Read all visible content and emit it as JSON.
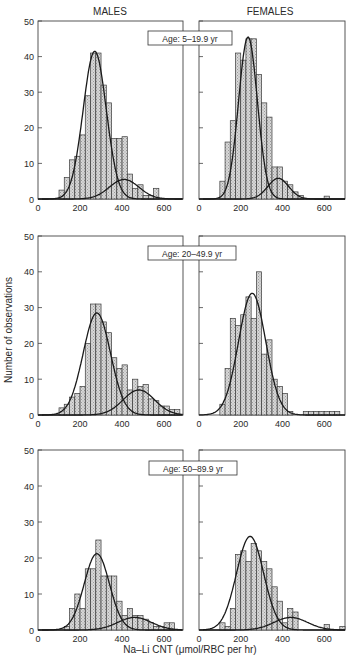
{
  "figure": {
    "column_titles": [
      "MALES",
      "FEMALES"
    ],
    "ylabel": "Number of observations",
    "xlabel": "Na–Li CNT (μmol/RBC per hr)",
    "yticks": [
      0,
      10,
      20,
      30,
      40,
      50
    ],
    "xticks": [
      0,
      200,
      400,
      600
    ],
    "age_labels": [
      "Age: 5–19.9 yr",
      "Age: 20–49.9 yr",
      "Age: 50–89.9 yr"
    ]
  },
  "chart_data": [
    {
      "type": "bar",
      "title": "MALES, Age: 5–19.9 yr",
      "xlabel": "Na–Li CNT (μmol/RBC per hr)",
      "ylabel": "Number of observations",
      "xlim": [
        0,
        690
      ],
      "ylim": [
        0,
        50
      ],
      "bin_width": 25,
      "bin_starts": [
        100,
        125,
        150,
        175,
        200,
        225,
        250,
        275,
        300,
        325,
        350,
        375,
        400,
        425,
        450,
        475,
        500,
        525,
        550
      ],
      "values": [
        2.5,
        6,
        11,
        12,
        18,
        29,
        41,
        41,
        32,
        27,
        17,
        17,
        17.5,
        7,
        3,
        4,
        1,
        1,
        3
      ],
      "fits": [
        {
          "name": "component 1",
          "mean": 270,
          "sd": 55,
          "peak": 41.5
        },
        {
          "name": "component 2",
          "mean": 410,
          "sd": 70,
          "peak": 5.5
        }
      ]
    },
    {
      "type": "bar",
      "title": "FEMALES, Age: 5–19.9 yr",
      "xlabel": "Na–Li CNT (μmol/RBC per hr)",
      "ylabel": "Number of observations",
      "xlim": [
        0,
        700
      ],
      "ylim": [
        0,
        50
      ],
      "bin_width": 25,
      "bin_starts": [
        100,
        125,
        150,
        175,
        200,
        225,
        250,
        275,
        300,
        325,
        350,
        375,
        400,
        425,
        450,
        475,
        600
      ],
      "values": [
        5,
        16,
        22,
        41,
        39,
        45,
        45,
        35,
        27,
        23,
        9,
        9,
        5,
        4,
        2,
        1,
        0.8
      ],
      "fits": [
        {
          "name": "component 1",
          "mean": 235,
          "sd": 45,
          "peak": 45.5
        },
        {
          "name": "component 2",
          "mean": 380,
          "sd": 50,
          "peak": 5.8
        }
      ]
    },
    {
      "type": "bar",
      "title": "MALES, Age: 20–49.9 yr",
      "xlabel": "Na–Li CNT (μmol/RBC per hr)",
      "ylabel": "Number of observations",
      "xlim": [
        0,
        690
      ],
      "ylim": [
        0,
        50
      ],
      "bin_width": 25,
      "bin_starts": [
        100,
        125,
        150,
        175,
        200,
        225,
        250,
        275,
        300,
        325,
        350,
        375,
        400,
        425,
        450,
        475,
        500,
        525,
        550,
        575,
        600,
        625,
        650
      ],
      "values": [
        2,
        3,
        5,
        6,
        8,
        20,
        31,
        31,
        26,
        23,
        16,
        13,
        14,
        7,
        10,
        8,
        8.5,
        4.5,
        4,
        2.5,
        2.5,
        1.5,
        1.5
      ],
      "fits": [
        {
          "name": "component 1",
          "mean": 280,
          "sd": 65,
          "peak": 28.5
        },
        {
          "name": "component 2",
          "mean": 480,
          "sd": 75,
          "peak": 7
        }
      ]
    },
    {
      "type": "bar",
      "title": "FEMALES, Age: 20–49.9 yr",
      "xlabel": "Na–Li CNT (μmol/RBC per hr)",
      "ylabel": "Number of observations",
      "xlim": [
        0,
        700
      ],
      "ylim": [
        0,
        50
      ],
      "bin_width": 25,
      "bin_starts": [
        100,
        125,
        150,
        175,
        200,
        225,
        250,
        275,
        300,
        325,
        350,
        375,
        400,
        425,
        500,
        525,
        550,
        575,
        600,
        625,
        650
      ],
      "values": [
        3,
        13,
        27,
        25,
        28,
        33,
        27,
        40,
        17,
        21,
        10,
        8,
        6,
        1,
        1,
        1,
        1,
        1,
        1,
        1,
        1
      ],
      "fits": [
        {
          "name": "component 1",
          "mean": 255,
          "sd": 65,
          "peak": 34
        }
      ]
    },
    {
      "type": "bar",
      "title": "MALES, Age: 50–89.9 yr",
      "xlabel": "Na–Li CNT (μmol/RBC per hr)",
      "ylabel": "Number of observations",
      "xlim": [
        0,
        690
      ],
      "ylim": [
        0,
        50
      ],
      "bin_width": 25,
      "bin_starts": [
        125,
        150,
        175,
        200,
        225,
        250,
        275,
        300,
        325,
        350,
        375,
        400,
        425,
        450,
        475,
        500,
        525,
        550,
        575,
        600,
        625
      ],
      "values": [
        1,
        6,
        10,
        6,
        17,
        17,
        25,
        15,
        15,
        15,
        8,
        4,
        6,
        4,
        4,
        3,
        2,
        1,
        1,
        2,
        2
      ],
      "fits": [
        {
          "name": "component 1",
          "mean": 280,
          "sd": 60,
          "peak": 21.2
        },
        {
          "name": "component 2",
          "mean": 460,
          "sd": 80,
          "peak": 3.5
        }
      ]
    },
    {
      "type": "bar",
      "title": "FEMALES, Age: 50–89.9 yr",
      "xlabel": "Na–Li CNT (μmol/RBC per hr)",
      "ylabel": "Number of observations",
      "xlim": [
        0,
        700
      ],
      "ylim": [
        0,
        50
      ],
      "bin_width": 25,
      "bin_starts": [
        100,
        125,
        150,
        175,
        200,
        225,
        250,
        275,
        300,
        325,
        350,
        375,
        400,
        425,
        450,
        600,
        675
      ],
      "values": [
        2,
        1,
        6,
        21,
        22,
        19,
        24,
        22,
        19,
        17,
        12,
        8,
        2,
        6,
        5,
        1.5,
        1
      ],
      "fits": [
        {
          "name": "component 1",
          "mean": 245,
          "sd": 65,
          "peak": 26
        },
        {
          "name": "component 2",
          "mean": 440,
          "sd": 80,
          "peak": 3.5
        }
      ]
    }
  ]
}
